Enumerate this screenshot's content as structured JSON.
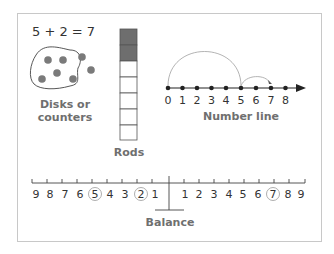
{
  "diagram": {
    "equation": "5 + 2 = 7",
    "labels": {
      "disks": "Disks or counters",
      "disks_line1": "Disks or",
      "disks_line2": "counters",
      "rods": "Rods",
      "number_line": "Number line",
      "balance": "Balance"
    },
    "disks": {
      "inside_count": 5,
      "outside_count": 2,
      "color": "#7a7a7a"
    },
    "rods": {
      "total_cells": 7,
      "shaded_cells": 2,
      "shaded_color": "#6e6e6e"
    },
    "number_line": {
      "ticks": [
        "0",
        "1",
        "2",
        "3",
        "4",
        "5",
        "6",
        "7",
        "8"
      ],
      "jumps": [
        {
          "from": 0,
          "to": 5
        },
        {
          "from": 5,
          "to": 7
        }
      ]
    },
    "balance": {
      "left_labels": [
        "9",
        "8",
        "7",
        "6",
        "5",
        "4",
        "3",
        "2",
        "1"
      ],
      "right_labels": [
        "1",
        "2",
        "3",
        "4",
        "5",
        "6",
        "7",
        "8",
        "9"
      ],
      "circled_left": [
        "5",
        "2"
      ],
      "circled_right": [
        "7"
      ]
    }
  }
}
